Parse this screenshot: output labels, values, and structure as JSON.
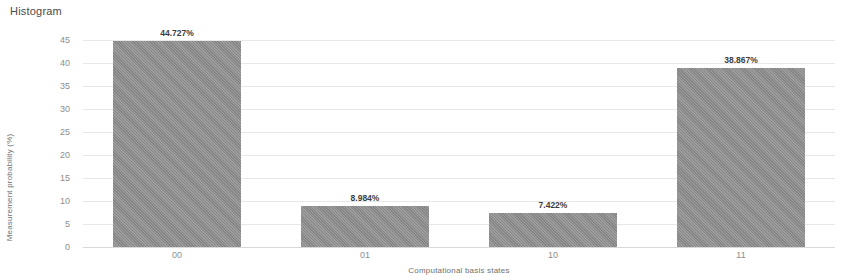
{
  "chart_data": {
    "type": "bar",
    "title": "Histogram",
    "xlabel": "Computational basis states",
    "ylabel": "Measurement probability (%)",
    "categories": [
      "00",
      "01",
      "10",
      "11"
    ],
    "values": [
      44.727,
      8.984,
      7.422,
      38.867
    ],
    "value_labels": [
      "44.727%",
      "8.984%",
      "7.422%",
      "38.867%"
    ],
    "ylim": [
      0,
      45
    ],
    "yticks": [
      "45",
      "40",
      "35",
      "30",
      "25",
      "20",
      "15",
      "10",
      "5",
      "0"
    ],
    "ytick_values": [
      45,
      40,
      35,
      30,
      25,
      20,
      15,
      10,
      5,
      0
    ],
    "grid": true,
    "legend": false,
    "bar_color": "#8c8c8c",
    "grid_color": "#e8e8e8"
  }
}
